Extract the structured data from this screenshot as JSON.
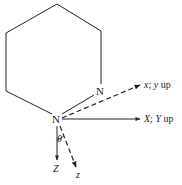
{
  "diagram": {
    "type": "molecular coordinate frame",
    "ring": {
      "atoms": [
        {
          "label": "N",
          "position": "right-lower"
        },
        {
          "label": "N",
          "position": "bottom"
        }
      ]
    },
    "axes": [
      {
        "id": "x",
        "label_axis": "x",
        "label_sep": ";",
        "label_axis2": "y",
        "label_suffix": "up",
        "style": "dashed"
      },
      {
        "id": "X",
        "label_axis": "X",
        "label_sep": ";",
        "label_axis2": "Y",
        "label_suffix": "up",
        "style": "solid"
      },
      {
        "id": "Z",
        "label_axis": "Z",
        "style": "solid"
      },
      {
        "id": "z",
        "label_axis": "z",
        "style": "dashed"
      }
    ],
    "angle": {
      "label": "θ"
    },
    "colors": {
      "line": "#222222",
      "background": "#ffffff"
    }
  }
}
